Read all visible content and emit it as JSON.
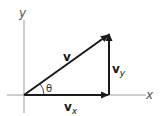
{
  "diagram": {
    "axes": {
      "x_label": "x",
      "y_label": "y"
    },
    "vectors": {
      "v": {
        "label": "v"
      },
      "vx": {
        "label": "v",
        "subscript": "x"
      },
      "vy": {
        "label": "v",
        "subscript": "y"
      }
    },
    "angle": {
      "label": "θ"
    },
    "colors": {
      "axis": "#9a9a9a",
      "vector": "#1a1a1a",
      "background": "#ffffff"
    }
  }
}
